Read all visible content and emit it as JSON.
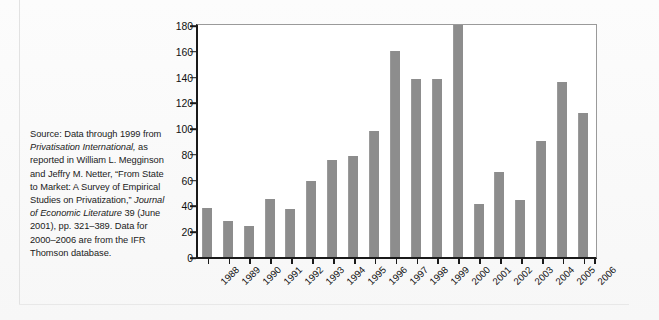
{
  "source_note": {
    "segments": [
      {
        "text": "Source: Data through 1999 from ",
        "italic": false
      },
      {
        "text": "Privatisation International,",
        "italic": true
      },
      {
        "text": " as reported in William L. Megginson and Jeffry M. Netter, “From State to Market: A Survey of Empirical Studies on Privatization,” ",
        "italic": false
      },
      {
        "text": "Journal of Economic Literature",
        "italic": true
      },
      {
        "text": " 39 (June 2001), pp. 321–389. Data for 2000–2006 are from the IFR Thomson database.",
        "italic": false
      }
    ]
  },
  "chart_data": {
    "type": "bar",
    "title": "",
    "subtitle": "",
    "xlabel": "",
    "ylabel": "",
    "categories": [
      "1988",
      "1989",
      "1990",
      "1991",
      "1992",
      "1993",
      "1994",
      "1995",
      "1996",
      "1997",
      "1998",
      "1999",
      "2000",
      "2001",
      "2002",
      "2003",
      "2004",
      "2005",
      "2006"
    ],
    "values": [
      38,
      28,
      24,
      45,
      37,
      59,
      75,
      78,
      98,
      160,
      138,
      138,
      180,
      41,
      66,
      44,
      90,
      136,
      112
    ],
    "series": [
      {
        "name": "Privatization proceeds",
        "values": [
          38,
          28,
          24,
          45,
          37,
          59,
          75,
          78,
          98,
          160,
          138,
          138,
          180,
          41,
          66,
          44,
          90,
          136,
          112
        ]
      }
    ],
    "ylim": [
      0,
      180
    ],
    "ytick_values": [
      0,
      20,
      40,
      60,
      80,
      100,
      120,
      140,
      160,
      180
    ],
    "ytick_labels": [
      "0",
      "20",
      "40",
      "60",
      "80",
      "100",
      "120",
      "140",
      "160",
      "180"
    ],
    "grid": false,
    "legend": null,
    "legend_position": "none",
    "bar_color": "#8d8d8d",
    "axis_color": "#1a1a1a",
    "plot_background": "#ffffff"
  }
}
